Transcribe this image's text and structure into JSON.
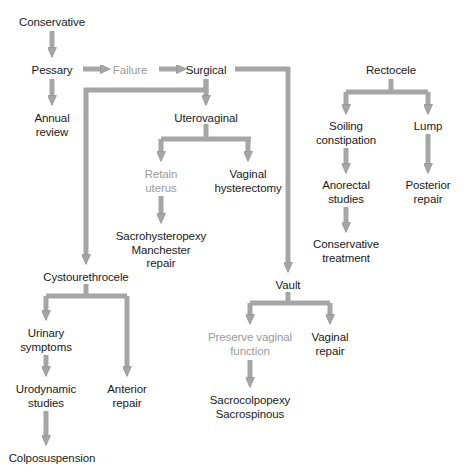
{
  "diagram": {
    "colors": {
      "arrow": "#a6a6a6",
      "arrow_outline": "#8f8f8f",
      "text": "#1a1a1a",
      "text_muted": "#9a9a9a",
      "background": "#ffffff"
    },
    "nodes": [
      {
        "id": "conservative",
        "label": "Conservative",
        "x": 52,
        "y": 16,
        "muted": false
      },
      {
        "id": "pessary",
        "label": "Pessary",
        "x": 52,
        "y": 64,
        "muted": false
      },
      {
        "id": "annual-review",
        "label": "Annual\nreview",
        "x": 52,
        "y": 112,
        "muted": false
      },
      {
        "id": "failure",
        "label": "Failure",
        "x": 130,
        "y": 64,
        "muted": true
      },
      {
        "id": "surgical",
        "label": "Surgical",
        "x": 206,
        "y": 64,
        "muted": false
      },
      {
        "id": "uterovaginal",
        "label": "Uterovaginal",
        "x": 206,
        "y": 112,
        "muted": false
      },
      {
        "id": "retain-uterus",
        "label": "Retain\nuterus",
        "x": 161,
        "y": 168,
        "muted": true
      },
      {
        "id": "vaginal-hysterectomy",
        "label": "Vaginal\nhysterectomy",
        "x": 248,
        "y": 168,
        "muted": false
      },
      {
        "id": "sacrohysteropexy",
        "label": "Sacrohysteropexy\nManchester\nrepair",
        "x": 161,
        "y": 230,
        "muted": false
      },
      {
        "id": "cystourethrocele",
        "label": "Cystourethrocele",
        "x": 86,
        "y": 271,
        "muted": false
      },
      {
        "id": "urinary-symptoms",
        "label": "Urinary\nsymptoms",
        "x": 46,
        "y": 327,
        "muted": false
      },
      {
        "id": "anterior-repair",
        "label": "Anterior\nrepair",
        "x": 127,
        "y": 383,
        "muted": false
      },
      {
        "id": "urodynamic-studies",
        "label": "Urodynamic\nstudies",
        "x": 46,
        "y": 383,
        "muted": false
      },
      {
        "id": "colposuspension",
        "label": "Colposuspension",
        "x": 52,
        "y": 452,
        "muted": false
      },
      {
        "id": "vault",
        "label": "Vault",
        "x": 288,
        "y": 279,
        "muted": false
      },
      {
        "id": "preserve-vaginal",
        "label": "Preserve vaginal\nfunction",
        "x": 250,
        "y": 331,
        "muted": true
      },
      {
        "id": "vaginal-repair",
        "label": "Vaginal\nrepair",
        "x": 330,
        "y": 331,
        "muted": false
      },
      {
        "id": "sacrocolpopexy",
        "label": "Sacrocolpopexy\nSacrospinous",
        "x": 250,
        "y": 394,
        "muted": false
      },
      {
        "id": "rectocele",
        "label": "Rectocele",
        "x": 391,
        "y": 64,
        "muted": false
      },
      {
        "id": "soiling",
        "label": "Soiling\nconstipation",
        "x": 346,
        "y": 120,
        "muted": false
      },
      {
        "id": "lump",
        "label": "Lump",
        "x": 428,
        "y": 120,
        "muted": false
      },
      {
        "id": "anorectal-studies",
        "label": "Anorectal\nstudies",
        "x": 346,
        "y": 179,
        "muted": false
      },
      {
        "id": "posterior-repair",
        "label": "Posterior\nrepair",
        "x": 428,
        "y": 179,
        "muted": false
      },
      {
        "id": "conservative-treat",
        "label": "Conservative\ntreatment",
        "x": 346,
        "y": 238,
        "muted": false
      }
    ],
    "edges": [
      {
        "id": "conservative-to-pessary",
        "from": "conservative",
        "to": "pessary",
        "kind": "down"
      },
      {
        "id": "pessary-to-annual-review",
        "from": "pessary",
        "to": "annual-review",
        "kind": "down"
      },
      {
        "id": "pessary-to-failure",
        "from": "pessary",
        "to": "failure",
        "kind": "right"
      },
      {
        "id": "failure-to-surgical",
        "from": "failure",
        "to": "surgical",
        "kind": "right"
      },
      {
        "id": "surgical-to-uterovaginal",
        "from": "surgical",
        "to": "uterovaginal",
        "kind": "down"
      },
      {
        "id": "surgical-to-cystourethrocele",
        "from": "surgical",
        "to": "cystourethrocele",
        "kind": "elbow-left-down"
      },
      {
        "id": "surgical-to-vault",
        "from": "surgical",
        "to": "vault",
        "kind": "elbow-right-down"
      },
      {
        "id": "uterovaginal-to-retain-uterus",
        "from": "uterovaginal",
        "to": "retain-uterus",
        "kind": "split-down"
      },
      {
        "id": "uterovaginal-to-hysterectomy",
        "from": "uterovaginal",
        "to": "vaginal-hysterectomy",
        "kind": "split-down"
      },
      {
        "id": "retain-uterus-to-sacrohysteropexy",
        "from": "retain-uterus",
        "to": "sacrohysteropexy",
        "kind": "down"
      },
      {
        "id": "cystourethrocele-to-urinary",
        "from": "cystourethrocele",
        "to": "urinary-symptoms",
        "kind": "split-down"
      },
      {
        "id": "cystourethrocele-to-anterior",
        "from": "cystourethrocele",
        "to": "anterior-repair",
        "kind": "split-down"
      },
      {
        "id": "urinary-to-urodynamic",
        "from": "urinary-symptoms",
        "to": "urodynamic-studies",
        "kind": "down"
      },
      {
        "id": "urodynamic-to-colposuspension",
        "from": "urodynamic-studies",
        "to": "colposuspension",
        "kind": "down"
      },
      {
        "id": "vault-to-preserve",
        "from": "vault",
        "to": "preserve-vaginal",
        "kind": "split-down"
      },
      {
        "id": "vault-to-vaginal-repair",
        "from": "vault",
        "to": "vaginal-repair",
        "kind": "split-down"
      },
      {
        "id": "preserve-to-sacrocolpopexy",
        "from": "preserve-vaginal",
        "to": "sacrocolpopexy",
        "kind": "down"
      },
      {
        "id": "rectocele-to-soiling",
        "from": "rectocele",
        "to": "soiling",
        "kind": "split-down"
      },
      {
        "id": "rectocele-to-lump",
        "from": "rectocele",
        "to": "lump",
        "kind": "split-down"
      },
      {
        "id": "soiling-to-anorectal",
        "from": "soiling",
        "to": "anorectal-studies",
        "kind": "down"
      },
      {
        "id": "anorectal-to-conservative-treat",
        "from": "anorectal-studies",
        "to": "conservative-treat",
        "kind": "down"
      },
      {
        "id": "lump-to-posterior-repair",
        "from": "lump",
        "to": "posterior-repair",
        "kind": "down"
      }
    ]
  }
}
